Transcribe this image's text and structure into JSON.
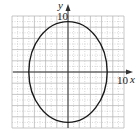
{
  "chart_data": {
    "type": "line",
    "title": "",
    "xlabel": "x",
    "ylabel": "y",
    "xlim": [
      -10,
      10
    ],
    "ylim": [
      -10,
      10
    ],
    "grid": true,
    "grid_step": 2,
    "tick_labels": {
      "x": "10",
      "y": "10"
    },
    "series": [
      {
        "name": "ellipse",
        "shape": "ellipse",
        "center": [
          0,
          0
        ],
        "semi_axis_x": 7,
        "semi_axis_y": 9,
        "equation": "x^2/49 + y^2/81 = 1"
      }
    ],
    "colors": {
      "curve": "#1a1a1a",
      "grid": "#b0b0b0",
      "axis": "#333333"
    }
  },
  "labels": {
    "x_axis": "x",
    "y_axis": "y",
    "x_tick": "10",
    "y_tick": "10"
  }
}
